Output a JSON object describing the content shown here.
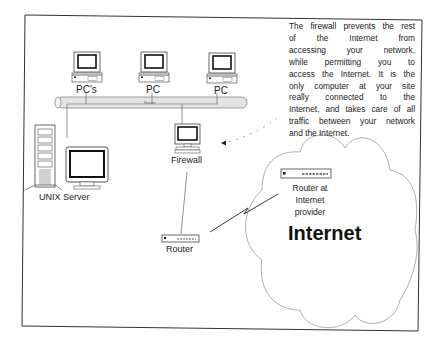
{
  "diagram": {
    "nodes": {
      "pc1": {
        "label": "PC's"
      },
      "pc2": {
        "label": "PC"
      },
      "pc3": {
        "label": "PC"
      },
      "ethernet": {
        "label": "Ethernet"
      },
      "unix_server": {
        "label": "UNIX Server"
      },
      "firewall": {
        "label": "Firewall"
      },
      "router": {
        "label": "Router"
      },
      "provider_router": {
        "label_lines": [
          "Router at",
          "Internet",
          "provider"
        ]
      },
      "internet": {
        "label": "Internet"
      }
    },
    "note": {
      "lines": [
        "The firewall prevents the rest",
        "of the Internet from",
        "accessing your network,",
        "while permitting you to",
        "access the Internet. It is the",
        "only computer at your site",
        "really connected to the",
        "Internet, and takes care of all",
        "traffic between your network",
        "and the Internet."
      ]
    },
    "edges": [
      {
        "from": "pc1",
        "to": "ethernet"
      },
      {
        "from": "pc2",
        "to": "ethernet"
      },
      {
        "from": "pc3",
        "to": "ethernet"
      },
      {
        "from": "unix_server",
        "to": "ethernet"
      },
      {
        "from": "firewall",
        "to": "ethernet"
      },
      {
        "from": "firewall",
        "to": "router"
      },
      {
        "from": "router",
        "to": "provider_router",
        "style": "lightning"
      },
      {
        "from": "note",
        "to": "firewall",
        "style": "dotted-arrow"
      }
    ],
    "colors": {
      "line": "#555555",
      "cloud": "#9a9a9a",
      "ethernet_fill": "#e4e4e4",
      "frame": "#333333"
    }
  }
}
